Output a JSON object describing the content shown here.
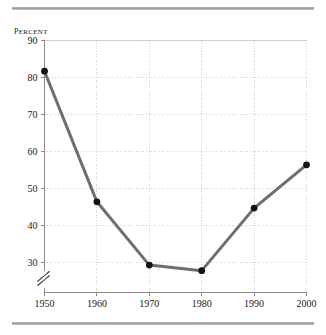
{
  "chart_data": {
    "type": "line",
    "title": "",
    "subtitle": "",
    "xlabel": "",
    "ylabel": "Percent",
    "x": [
      1950,
      1960,
      1970,
      1980,
      1990,
      2000
    ],
    "categories": [
      "1950",
      "1960",
      "1970",
      "1980",
      "1990",
      "2000"
    ],
    "values": [
      81.7,
      46.4,
      29.3,
      27.8,
      44.7,
      56.4
    ],
    "series": [
      {
        "name": "Percent",
        "values": [
          81.7,
          46.4,
          29.3,
          27.8,
          44.7,
          56.4
        ]
      }
    ],
    "xlim": [
      1950,
      2000
    ],
    "ylim": [
      30,
      90
    ],
    "y_axis_broken": true,
    "y_ticks": [
      30,
      40,
      50,
      60,
      70,
      80,
      90
    ],
    "y_tick_labels": [
      "30",
      "40",
      "50",
      "60",
      "70",
      "80",
      "90"
    ],
    "x_ticks": [
      1950,
      1960,
      1970,
      1980,
      1990,
      2000
    ],
    "x_tick_labels": [
      "1950",
      "1960",
      "1970",
      "1980",
      "1990",
      "2000"
    ],
    "grid": true,
    "grid_style": "dotted",
    "legend": false,
    "legend_position": "none",
    "annotations": [
      "axis-break"
    ]
  },
  "figure": {
    "y_axis_caption": "Percent",
    "line_color": "#6e6e6e",
    "marker_color": "#141414",
    "grid_color": "#c8c8c8",
    "axis_color": "#8a8a8a",
    "rule_color": "#a5a5a5",
    "background": "#ffffff"
  }
}
